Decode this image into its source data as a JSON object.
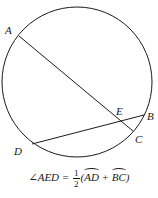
{
  "diagram": {
    "circle": {
      "cx": 77,
      "cy": 82,
      "r": 75,
      "stroke": "#1a1a1a"
    },
    "points": {
      "A": {
        "x": 19,
        "y": 36,
        "label": "A",
        "lx": 5,
        "ly": 34
      },
      "B": {
        "x": 144,
        "y": 115,
        "label": "B",
        "lx": 147,
        "ly": 120
      },
      "C": {
        "x": 133,
        "y": 131,
        "label": "C",
        "lx": 135,
        "ly": 143
      },
      "D": {
        "x": 32,
        "y": 144,
        "label": "D",
        "lx": 14,
        "ly": 155
      },
      "E": {
        "x": 120,
        "y": 120,
        "label": "E",
        "lx": 116,
        "ly": 115
      }
    },
    "chords": [
      {
        "from": "A",
        "to": "C"
      },
      {
        "from": "D",
        "to": "B"
      }
    ]
  },
  "formula": {
    "angle": "∠AED",
    "equals": " = ",
    "num": "1",
    "den": "2",
    "open": "(",
    "arc1": "AD",
    "plus": " + ",
    "arc2": "BC",
    "close": ")"
  }
}
